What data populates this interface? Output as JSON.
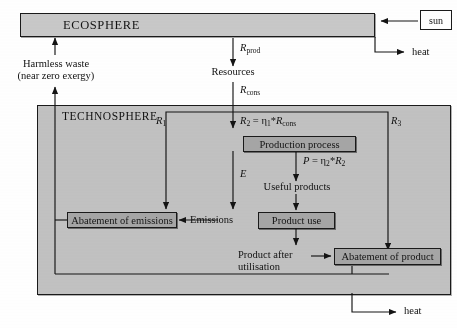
{
  "diagram": {
    "title_ecosphere": "ECOSPHERE",
    "title_technosphere": "TECHNOSPHERE",
    "external": {
      "sun": "sun",
      "heat_top": "heat",
      "heat_bottom": "heat"
    },
    "labels": {
      "harmless_waste_line1": "Harmless waste",
      "harmless_waste_line2": "(near zero exergy)",
      "r_prod": "R",
      "r_prod_sub": "prod",
      "resources": "Resources",
      "r_cons": "R",
      "r_cons_sub": "cons",
      "r1": "R",
      "r1_sub": "1",
      "r3": "R",
      "r3_sub": "3",
      "e_flow": "E",
      "emissions": "Emissions",
      "useful_products": "Useful products",
      "product_after_line1": "Product after",
      "product_after_line2": "utilisation"
    },
    "formulas": {
      "r2": {
        "lhs": "R",
        "lhs_sub": "2",
        "eq": " = ",
        "eta": "η",
        "eta_sub": "1",
        "star": "*",
        "rhs": "R",
        "rhs_sub": "cons"
      },
      "p": {
        "lhs": "P",
        "eq": " = ",
        "eta": "η",
        "eta_sub": "2",
        "star": "*",
        "rhs": "R",
        "rhs_sub": "2"
      }
    },
    "boxes": {
      "production_process": "Production process",
      "product_use": "Product use",
      "abatement_of_emissions": "Abatement of emissions",
      "abatement_of_product": "Abatement of product"
    },
    "colors": {
      "shaded_fill": "#a6a6a6",
      "ecosphere_fill": "#c9c9c9",
      "technosphere_fill": "#c2c2c2",
      "stroke": "#1a1a1a",
      "page_background": "#ffffff"
    }
  }
}
